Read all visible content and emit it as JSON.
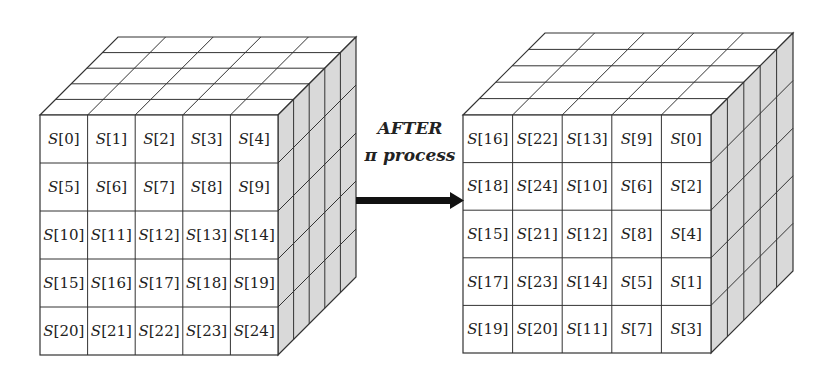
{
  "diagram": {
    "before_cube": {
      "label": "state array before pi",
      "rows": [
        [
          "S[0]",
          "S[1]",
          "S[2]",
          "S[3]",
          "S[4]"
        ],
        [
          "S[5]",
          "S[6]",
          "S[7]",
          "S[8]",
          "S[9]"
        ],
        [
          "S[10]",
          "S[11]",
          "S[12]",
          "S[13]",
          "S[14]"
        ],
        [
          "S[15]",
          "S[16]",
          "S[17]",
          "S[18]",
          "S[19]"
        ],
        [
          "S[20]",
          "S[21]",
          "S[22]",
          "S[23]",
          "S[24]"
        ]
      ]
    },
    "arrow": {
      "line1": "AFTER",
      "line2": "π process"
    },
    "after_cube": {
      "label": "state array after pi",
      "rows": [
        [
          "S[16]",
          "S[22]",
          "S[13]",
          "S[9]",
          "S[0]"
        ],
        [
          "S[18]",
          "S[24]",
          "S[10]",
          "S[6]",
          "S[2]"
        ],
        [
          "S[15]",
          "S[21]",
          "S[12]",
          "S[8]",
          "S[4]"
        ],
        [
          "S[17]",
          "S[23]",
          "S[14]",
          "S[5]",
          "S[1]"
        ],
        [
          "S[19]",
          "S[20]",
          "S[11]",
          "S[7]",
          "S[3]"
        ]
      ]
    },
    "colors": {
      "line": "#333333",
      "top_face": "#ffffff",
      "side_face": "#d9d9d9",
      "front_face": "#ffffff",
      "arrow": "#111111"
    }
  }
}
